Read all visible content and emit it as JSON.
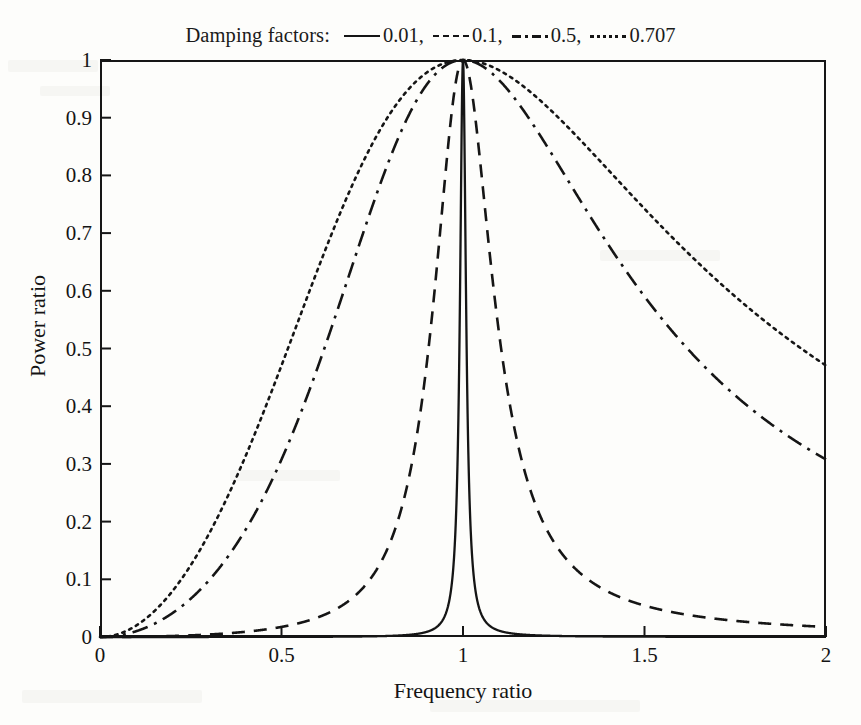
{
  "chart_data": {
    "type": "line",
    "title": "",
    "xlabel": "Frequency ratio",
    "ylabel": "Power ratio",
    "xlim": [
      0,
      2
    ],
    "ylim": [
      0,
      1
    ],
    "xticks": [
      "0",
      "0.5",
      "1",
      "1.5",
      "2"
    ],
    "xtick_values": [
      0,
      0.5,
      1,
      1.5,
      2
    ],
    "yticks": [
      "0",
      "0.1",
      "0.2",
      "0.3",
      "0.4",
      "0.5",
      "0.6",
      "0.7",
      "0.8",
      "0.9",
      "1"
    ],
    "ytick_values": [
      0,
      0.1,
      0.2,
      0.3,
      0.4,
      0.5,
      0.6,
      0.7,
      0.8,
      0.9,
      1
    ],
    "grid": false,
    "legend_position": "above-plot",
    "legend_title": "Damping factors:",
    "line_color": "#151515",
    "series": [
      {
        "name": "0.01",
        "label": "0.01,",
        "damping": 0.01,
        "style": "solid",
        "x": [
          0,
          0.1,
          0.2,
          0.3,
          0.4,
          0.5,
          0.6,
          0.7,
          0.8,
          0.9,
          0.95,
          0.98,
          0.99,
          0.995,
          1,
          1.005,
          1.01,
          1.02,
          1.05,
          1.1,
          1.2,
          1.3,
          1.4,
          1.5,
          1.6,
          1.7,
          1.8,
          1.9,
          2
        ],
        "y": [
          0.0,
          0.0,
          0.0,
          0.0,
          0.0,
          0.0,
          0.001,
          0.001,
          0.001,
          0.003,
          0.01,
          0.059,
          0.201,
          0.499,
          1.0,
          0.499,
          0.201,
          0.059,
          0.01,
          0.003,
          0.001,
          0.0,
          0.0,
          0.0,
          0.0,
          0.0,
          0.0,
          0.0,
          0.0
        ]
      },
      {
        "name": "0.1",
        "label": "0.1,",
        "damping": 0.1,
        "style": "dashed",
        "x": [
          0,
          0.1,
          0.2,
          0.3,
          0.4,
          0.5,
          0.6,
          0.7,
          0.8,
          0.85,
          0.9,
          0.95,
          1,
          1.05,
          1.1,
          1.15,
          1.2,
          1.3,
          1.4,
          1.5,
          1.6,
          1.7,
          1.8,
          1.9,
          2
        ],
        "y": [
          0.0,
          0.0,
          0.002,
          0.005,
          0.01,
          0.018,
          0.031,
          0.056,
          0.112,
          0.173,
          0.304,
          0.612,
          1.0,
          0.647,
          0.348,
          0.202,
          0.128,
          0.062,
          0.036,
          0.023,
          0.016,
          0.012,
          0.009,
          0.008,
          0.019
        ]
      },
      {
        "name": "0.5",
        "label": "0.5,",
        "damping": 0.5,
        "style": "dashdot",
        "x": [
          0,
          0.1,
          0.2,
          0.3,
          0.4,
          0.5,
          0.6,
          0.7,
          0.8,
          0.9,
          1,
          1.1,
          1.2,
          1.3,
          1.4,
          1.5,
          1.6,
          1.7,
          1.8,
          1.9,
          2
        ],
        "y": [
          0.0,
          0.011,
          0.043,
          0.097,
          0.17,
          0.262,
          0.369,
          0.49,
          0.62,
          0.78,
          1.0,
          0.855,
          0.726,
          0.645,
          0.557,
          0.481,
          0.425,
          0.382,
          0.352,
          0.331,
          0.312
        ]
      },
      {
        "name": "0.707",
        "label": "0.707",
        "damping": 0.707,
        "style": "dotted",
        "x": [
          0,
          0.1,
          0.2,
          0.3,
          0.4,
          0.5,
          0.6,
          0.7,
          0.8,
          0.9,
          1,
          1.1,
          1.2,
          1.3,
          1.4,
          1.5,
          1.6,
          1.7,
          1.8,
          1.9,
          2
        ],
        "y": [
          0.0,
          0.021,
          0.083,
          0.182,
          0.31,
          0.452,
          0.59,
          0.715,
          0.83,
          0.925,
          1.0,
          0.93,
          0.858,
          0.79,
          0.725,
          0.662,
          0.605,
          0.555,
          0.52,
          0.49,
          0.47
        ]
      }
    ]
  },
  "legend": {
    "title": "Damping factors:",
    "entries": [
      {
        "label": "0.01,",
        "style": "solid"
      },
      {
        "label": "0.1,",
        "style": "dashed"
      },
      {
        "label": "0.5,",
        "style": "dashdot"
      },
      {
        "label": "0.707",
        "style": "dotted"
      }
    ]
  },
  "axes": {
    "x_title": "Frequency ratio",
    "y_title": "Power ratio"
  }
}
